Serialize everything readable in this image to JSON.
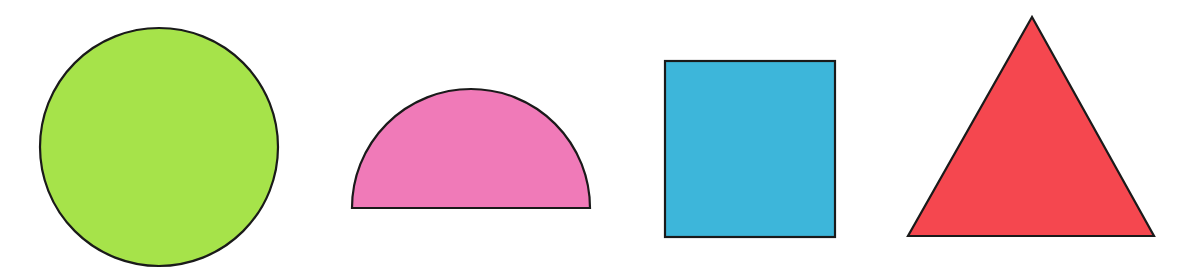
{
  "canvas": {
    "width": 1195,
    "height": 273,
    "background": "#ffffff"
  },
  "stroke": {
    "color": "#1a1a1a",
    "width": 2.2
  },
  "shapes": [
    {
      "name": "circle",
      "type": "circle",
      "fill": "#a6e34a",
      "cx": 159,
      "cy": 147,
      "r": 119
    },
    {
      "name": "semicircle",
      "type": "semicircle",
      "fill": "#f07ab8",
      "cx": 471,
      "base_y": 208,
      "r": 119
    },
    {
      "name": "square",
      "type": "rect",
      "fill": "#3db6da",
      "x": 665,
      "y": 61,
      "width": 170,
      "height": 176
    },
    {
      "name": "triangle",
      "type": "triangle",
      "fill": "#f5474f",
      "points": [
        [
          1032,
          17
        ],
        [
          908,
          236
        ],
        [
          1154,
          236
        ]
      ]
    }
  ]
}
